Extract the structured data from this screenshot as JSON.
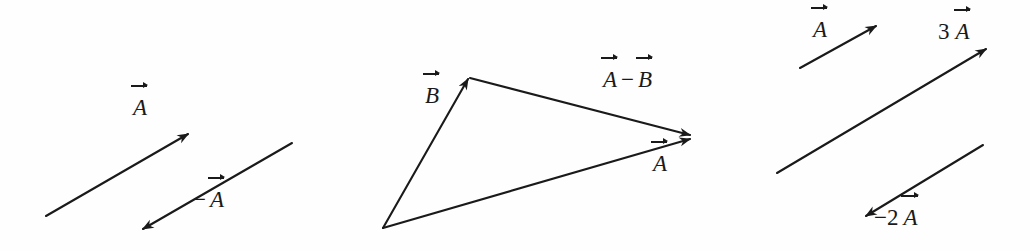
{
  "figure": {
    "background_color": "#fefefe",
    "ink_color": "#1a1a1a",
    "width": 1030,
    "height": 251
  },
  "panels": [
    {
      "id": "panel-negation",
      "name": "vector-negation-panel",
      "vectors": [
        {
          "id": "vector-a-left",
          "label_text": "A",
          "label_prefix": "",
          "has_overarrow": true,
          "x1": 46,
          "y1": 216,
          "x2": 188,
          "y2": 134,
          "label_x": 132,
          "label_y": 106
        },
        {
          "id": "vector-neg-a-left",
          "label_text": "A",
          "label_prefix": "−",
          "has_overarrow": true,
          "x1": 292,
          "y1": 143,
          "x2": 143,
          "y2": 229,
          "label_x": 190,
          "label_y": 190
        }
      ]
    },
    {
      "id": "panel-subtraction",
      "name": "vector-subtraction-panel",
      "vectors": [
        {
          "id": "vector-b-mid",
          "label_text": "B",
          "label_prefix": "",
          "has_overarrow": true,
          "x1": 383,
          "y1": 228,
          "x2": 468,
          "y2": 78,
          "label_x": 424,
          "label_y": 82
        },
        {
          "id": "vector-a-minus-b-mid",
          "label_text": "A − B",
          "label_prefix": "",
          "has_overarrow": true,
          "x1": 470,
          "y1": 79,
          "x2": 690,
          "y2": 136,
          "label_x": 600,
          "label_y": 70
        },
        {
          "id": "vector-a-mid",
          "label_text": "A",
          "label_prefix": "",
          "has_overarrow": true,
          "x1": 383,
          "y1": 228,
          "x2": 690,
          "y2": 139,
          "label_x": 652,
          "label_y": 152
        }
      ]
    },
    {
      "id": "panel-scaling",
      "name": "vector-scaling-panel",
      "vectors": [
        {
          "id": "vector-a-right",
          "label_text": "A",
          "label_prefix": "",
          "has_overarrow": true,
          "x1": 800,
          "y1": 68,
          "x2": 876,
          "y2": 26,
          "label_x": 812,
          "label_y": 17
        },
        {
          "id": "vector-3a-right",
          "label_text": "A",
          "label_prefix": "3",
          "has_overarrow": true,
          "x1": 777,
          "y1": 173,
          "x2": 986,
          "y2": 49,
          "label_x": 940,
          "label_y": 17
        },
        {
          "id": "vector-neg-2a-right",
          "label_text": "A",
          "label_prefix": "−2",
          "has_overarrow": true,
          "x1": 983,
          "y1": 145,
          "x2": 866,
          "y2": 216,
          "label_x": 874,
          "label_y": 204
        }
      ]
    }
  ],
  "labels": {
    "a_left": "A",
    "neg_a_left": "A",
    "neg_a_left_prefix": "−",
    "b_mid": "B",
    "a_mid": "A",
    "a_minus_b_first": "A",
    "a_minus_b_op": "−",
    "a_minus_b_second": "B",
    "a_right": "A",
    "three_a_coef": "3",
    "three_a": "A",
    "neg_two_a_coef": "−2",
    "neg_two_a": "A"
  }
}
